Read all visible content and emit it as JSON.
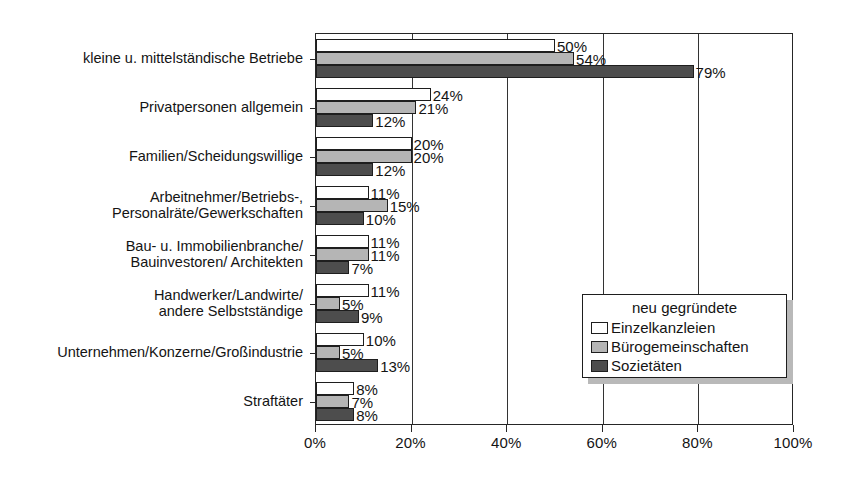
{
  "chart_data": {
    "type": "bar",
    "orientation": "horizontal",
    "title": "",
    "subtitle": "",
    "xlabel": "",
    "ylabel": "",
    "xlim": [
      0,
      100
    ],
    "xticks": [
      "0%",
      "20%",
      "40%",
      "60%",
      "80%",
      "100%"
    ],
    "xtick_values": [
      0,
      20,
      40,
      60,
      80,
      100
    ],
    "grid": true,
    "grid_axis": "x",
    "legend_position": "inside-lower-right",
    "legend_title": "neu gegründete",
    "categories": [
      "kleine u. mittelständische Betriebe",
      "Privatpersonen allgemein",
      "Familien/Scheidungswillige",
      "Arbeitnehmer/Betriebs-, Personalräte/Gewerkschaften",
      "Bau- u. Immobilienbranche/ Bauinvestoren/ Architekten",
      "Handwerker/Landwirte/ andere Selbstständige",
      "Unternehmen/Konzerne/Großindustrie",
      "Straftäter"
    ],
    "category_lines": [
      [
        "kleine u. mittelständische Betriebe"
      ],
      [
        "Privatpersonen allgemein"
      ],
      [
        "Familien/Scheidungswillige"
      ],
      [
        "Arbeitnehmer/Betriebs-,",
        "Personalräte/Gewerkschaften"
      ],
      [
        "Bau- u. Immobilienbranche/",
        "Bauinvestoren/ Architekten"
      ],
      [
        "Handwerker/Landwirte/",
        "andere Selbstständige"
      ],
      [
        "Unternehmen/Konzerne/Großindustrie"
      ],
      [
        "Straftäter"
      ]
    ],
    "series": [
      {
        "name": "Einzelkanzleien",
        "color": "#ffffff",
        "values": [
          50,
          24,
          20,
          11,
          11,
          11,
          10,
          8
        ],
        "labels": [
          "50%",
          "24%",
          "20%",
          "11%",
          "11%",
          "11%",
          "10%",
          "8%"
        ]
      },
      {
        "name": "Bürogemeinschaften",
        "color": "#b5b5b5",
        "values": [
          54,
          21,
          20,
          15,
          11,
          5,
          5,
          7
        ],
        "labels": [
          "54%",
          "21%",
          "20%",
          "15%",
          "11%",
          "5%",
          "5%",
          "7%"
        ]
      },
      {
        "name": "Sozietäten",
        "color": "#4d4d4d",
        "values": [
          79,
          12,
          12,
          10,
          7,
          9,
          13,
          8
        ],
        "labels": [
          "79%",
          "12%",
          "12%",
          "10%",
          "7%",
          "9%",
          "13%",
          "8%"
        ]
      }
    ]
  },
  "legend": {
    "title": "neu gegründete",
    "entries": [
      {
        "label": "Einzelkanzleien",
        "swatch": "s0"
      },
      {
        "label": "Bürogemeinschaften",
        "swatch": "s1"
      },
      {
        "label": "Sozietäten",
        "swatch": "s2"
      }
    ]
  },
  "axis": {
    "x_tick_labels": [
      "0%",
      "20%",
      "40%",
      "60%",
      "80%",
      "100%"
    ]
  }
}
